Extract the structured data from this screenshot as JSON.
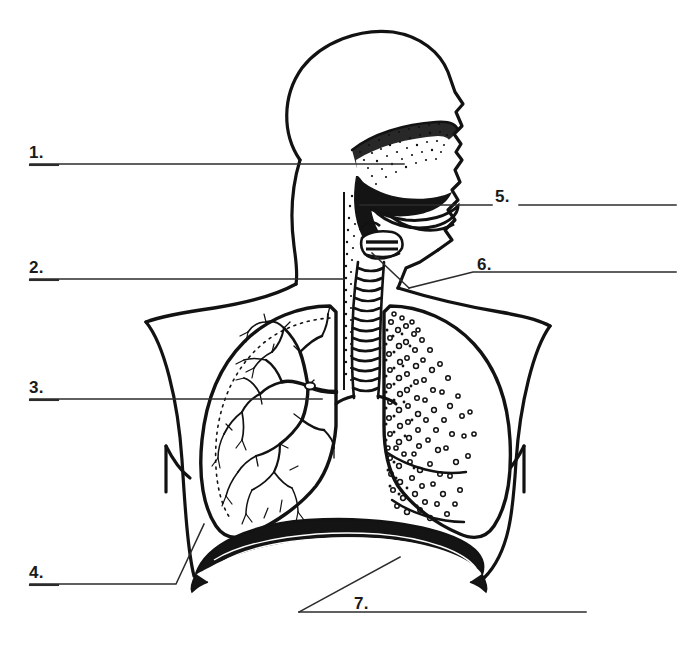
{
  "page": {
    "top_caption_partial": "",
    "background_color": "#ffffff",
    "ink_color": "#121212",
    "rule_color": "#2b2b2b"
  },
  "diagram": {
    "name": "human-respiratory-system-sagittal",
    "parts": [
      {
        "key": "head-profile",
        "label": "head-outline"
      },
      {
        "key": "nasal-cavity",
        "label": "nasal-cavity-stippled"
      },
      {
        "key": "oral-cavity",
        "label": "oral-cavity-tongue"
      },
      {
        "key": "pharynx",
        "label": "pharynx"
      },
      {
        "key": "larynx",
        "label": "larynx-epiglottis"
      },
      {
        "key": "trachea",
        "label": "trachea-cartilage-rings"
      },
      {
        "key": "left-lung",
        "label": "lung-bronchial-tree"
      },
      {
        "key": "right-lung",
        "label": "lung-alveoli"
      },
      {
        "key": "diaphragm",
        "label": "diaphragm-muscle"
      },
      {
        "key": "shoulders",
        "label": "shoulders-and-arms"
      }
    ]
  },
  "labels": [
    {
      "id": 1,
      "number": "1.",
      "answer_blank": true,
      "line": "horizontal-right"
    },
    {
      "id": 2,
      "number": "2.",
      "answer_blank": true,
      "line": "horizontal-right"
    },
    {
      "id": 3,
      "number": "3.",
      "answer_blank": true,
      "line": "horizontal-right"
    },
    {
      "id": 4,
      "number": "4.",
      "answer_blank": true,
      "line": "horizontal-then-diagonal-up-right"
    },
    {
      "id": 5,
      "number": "5.",
      "answer_blank": true,
      "line": "horizontal-both-sides"
    },
    {
      "id": 6,
      "number": "6.",
      "answer_blank": true,
      "line": "horizontal-right-diagonal-left"
    },
    {
      "id": 7,
      "number": "7.",
      "answer_blank": true,
      "line": "horizontal-right-diagonal-up-left"
    }
  ],
  "label_text": {
    "one": "1.",
    "two": "2.",
    "three": "3.",
    "four": "4.",
    "five": "5.",
    "six": "6.",
    "seven": "7."
  }
}
